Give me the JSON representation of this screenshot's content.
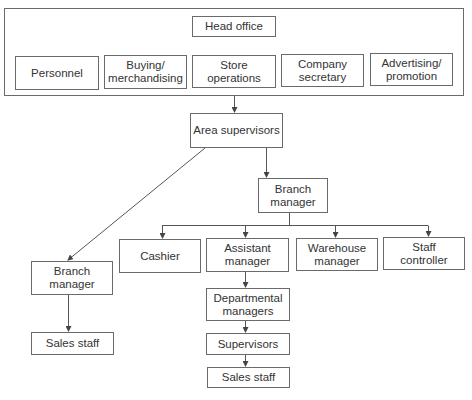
{
  "diagram": {
    "type": "organisation-chart",
    "head_office_group": {
      "title": "Head office",
      "departments": [
        "Personnel",
        "Buying/\nmerchandising",
        "Store operations",
        "Company\nsecretary",
        "Advertising/\npromotion"
      ]
    },
    "area_supervisors": "Area supervisors",
    "branch_manager_main": "Branch\nmanager",
    "branch_reports": [
      "Cashier",
      "Assistant\nmanager",
      "Warehouse\nmanager",
      "Staff\ncontroller"
    ],
    "assistant_chain": [
      "Departmental\nmanagers",
      "Supervisors",
      "Sales staff"
    ],
    "branch_manager_small": "Branch\nmanager",
    "small_branch_sales": "Sales staff",
    "line_color": "#555555",
    "box_border_color": "#6a6a6a"
  }
}
